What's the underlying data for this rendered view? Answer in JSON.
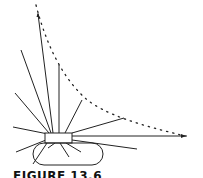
{
  "figure": {
    "caption": "FIGURE 13.6",
    "colors": {
      "line": "#222222",
      "background": "#ffffff"
    }
  }
}
